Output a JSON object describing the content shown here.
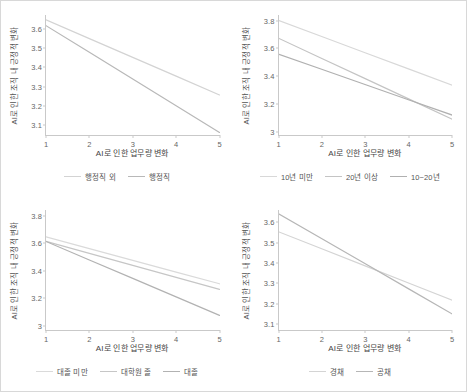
{
  "figure": {
    "background": "#ffffff",
    "border_color": "#d8d8d8",
    "axis_color": "#c9c9c9",
    "tick_text_color": "#666666"
  },
  "chart_data": [
    {
      "type": "line",
      "panel": "top-left",
      "title": "",
      "xlabel": "AI로 인한 업무량 변화",
      "ylabel": "AI로 인한 조직 내 긍정적 변화",
      "x": [
        1,
        2,
        3,
        4,
        5
      ],
      "xlim": [
        1,
        5
      ],
      "xticks": [
        "1",
        "2",
        "3",
        "4",
        "5"
      ],
      "ylim": [
        3.05,
        3.67
      ],
      "yticks": [
        "3.1",
        "3.2",
        "3.3",
        "3.4",
        "3.5",
        "3.6"
      ],
      "ytick_values": [
        3.1,
        3.2,
        3.3,
        3.4,
        3.5,
        3.6
      ],
      "grid": false,
      "legend_position": "bottom",
      "series": [
        {
          "name": "행정직 외",
          "color": "#d3d3d3",
          "values": [
            3.645,
            3.548,
            3.451,
            3.354,
            3.257
          ]
        },
        {
          "name": "행정직",
          "color": "#b8b8b8",
          "values": [
            3.615,
            3.477,
            3.339,
            3.201,
            3.063
          ]
        }
      ]
    },
    {
      "type": "line",
      "panel": "top-right",
      "title": "",
      "xlabel": "AI로 인한 업무량 변화",
      "ylabel": "AI로 인한 조직 내 긍정적 변화",
      "x": [
        1,
        2,
        3,
        4,
        5
      ],
      "xlim": [
        1,
        5
      ],
      "xticks": [
        "1",
        "2",
        "3",
        "4",
        "5"
      ],
      "ylim": [
        2.98,
        3.84
      ],
      "yticks": [
        "3",
        "3.2",
        "3.4",
        "3.6",
        "3.8"
      ],
      "ytick_values": [
        3.0,
        3.2,
        3.4,
        3.6,
        3.8
      ],
      "grid": false,
      "legend_position": "bottom",
      "series": [
        {
          "name": "10년 미만",
          "color": "#d8d8d8",
          "values": [
            3.8,
            3.684,
            3.568,
            3.452,
            3.336
          ]
        },
        {
          "name": "20년 이상",
          "color": "#c4c4c4",
          "values": [
            3.672,
            3.527,
            3.382,
            3.237,
            3.092
          ]
        },
        {
          "name": "10~20년",
          "color": "#b0b0b0",
          "values": [
            3.558,
            3.449,
            3.34,
            3.231,
            3.122
          ]
        }
      ]
    },
    {
      "type": "line",
      "panel": "bottom-left",
      "title": "",
      "xlabel": "AI로 인한 업무량 변화",
      "ylabel": "AI로 인한 조직 내 긍정적 변화",
      "x": [
        1,
        2,
        3,
        4,
        5
      ],
      "xlim": [
        1,
        5
      ],
      "xticks": [
        "1",
        "2",
        "3",
        "4",
        "5"
      ],
      "ylim": [
        2.97,
        3.84
      ],
      "yticks": [
        "3",
        "3.2",
        "3.4",
        "3.6",
        "3.8"
      ],
      "ytick_values": [
        3.0,
        3.2,
        3.4,
        3.6,
        3.8
      ],
      "grid": false,
      "legend_position": "bottom",
      "series": [
        {
          "name": "대졸 미만",
          "color": "#dadada",
          "values": [
            3.645,
            3.56,
            3.475,
            3.39,
            3.305
          ]
        },
        {
          "name": "대학원 졸",
          "color": "#c6c6c6",
          "values": [
            3.612,
            3.525,
            3.438,
            3.351,
            3.264
          ]
        },
        {
          "name": "대졸",
          "color": "#b2b2b2",
          "values": [
            3.612,
            3.478,
            3.344,
            3.21,
            3.076
          ]
        }
      ]
    },
    {
      "type": "line",
      "panel": "bottom-right",
      "title": "",
      "xlabel": "AI로 인한 업무량 변화",
      "ylabel": "AI로 인한 조직 내 긍정적 변화",
      "x": [
        1,
        2,
        3,
        4,
        5
      ],
      "xlim": [
        1,
        5
      ],
      "xticks": [
        "1",
        "2",
        "3",
        "4",
        "5"
      ],
      "ylim": [
        3.07,
        3.66
      ],
      "yticks": [
        "3.1",
        "3.2",
        "3.3",
        "3.4",
        "3.5",
        "3.6"
      ],
      "ytick_values": [
        3.1,
        3.2,
        3.3,
        3.4,
        3.5,
        3.6
      ],
      "grid": false,
      "legend_position": "bottom",
      "series": [
        {
          "name": "경채",
          "color": "#d4d4d4",
          "values": [
            3.552,
            3.468,
            3.384,
            3.3,
            3.216
          ]
        },
        {
          "name": "공채",
          "color": "#b6b6b6",
          "values": [
            3.64,
            3.517,
            3.394,
            3.271,
            3.148
          ]
        }
      ]
    }
  ]
}
